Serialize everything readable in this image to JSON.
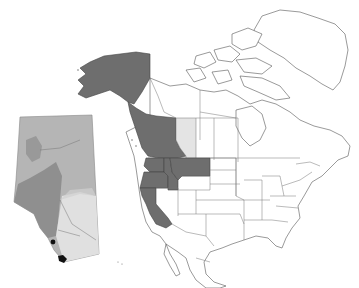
{
  "map": {
    "title": "",
    "subject": "Distribution range map, North America with Alberta inset",
    "colors": {
      "range_dark": "#6e6e6e",
      "range_light": "#e4e4e4",
      "land": "#ffffff",
      "outline": "#555555",
      "inset_north": "#b5b5b5",
      "inset_mountains": "#8f8f8f",
      "inset_south": "#e0e0e0",
      "occurrence_dots": "#111111"
    },
    "regions_shaded_dark": [
      "Alaska",
      "British Columbia",
      "Washington",
      "Oregon",
      "Idaho",
      "Montana",
      "California"
    ],
    "regions_shaded_light": [
      "Alberta"
    ],
    "inset": {
      "region": "Alberta",
      "occurrence_points": 2
    }
  }
}
